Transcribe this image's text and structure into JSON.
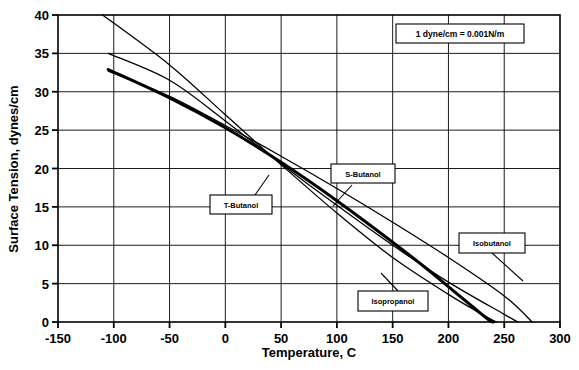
{
  "chart_data": {
    "type": "line",
    "title": "",
    "xlabel": "Temperature, C",
    "ylabel": "Surface Tension,  dynes/cm",
    "xlim": [
      -150,
      300
    ],
    "ylim": [
      0,
      40
    ],
    "xticks": [
      -150,
      -100,
      -50,
      0,
      50,
      100,
      150,
      200,
      250,
      300
    ],
    "yticks": [
      0,
      5,
      10,
      15,
      20,
      25,
      30,
      35,
      40
    ],
    "grid": true,
    "legend": "inline-callout-labels",
    "annotations": [
      {
        "name": "unit-note",
        "text": "1 dyne/cm = 0.001N/m"
      }
    ],
    "series": [
      {
        "name": "S-Butanol",
        "label": "S-Butanol",
        "emphasis": "thin",
        "points": [
          {
            "x": -110,
            "y": 40.0
          },
          {
            "x": -50,
            "y": 33.5
          },
          {
            "x": 0,
            "y": 27.0
          },
          {
            "x": 50,
            "y": 20.5
          },
          {
            "x": 100,
            "y": 14.2
          },
          {
            "x": 150,
            "y": 8.4
          },
          {
            "x": 200,
            "y": 3.6
          },
          {
            "x": 235,
            "y": 0.6
          },
          {
            "x": 243,
            "y": 0.0
          }
        ]
      },
      {
        "name": "T-Butanol",
        "label": "T-Butanol",
        "emphasis": "thin",
        "points": [
          {
            "x": -105,
            "y": 35.0
          },
          {
            "x": -50,
            "y": 31.5
          },
          {
            "x": 0,
            "y": 26.2
          },
          {
            "x": 50,
            "y": 20.6
          },
          {
            "x": 100,
            "y": 15.2
          },
          {
            "x": 150,
            "y": 10.0
          },
          {
            "x": 200,
            "y": 5.2
          },
          {
            "x": 250,
            "y": 1.0
          },
          {
            "x": 262,
            "y": 0.0
          }
        ]
      },
      {
        "name": "Isobutanol",
        "label": "Isobutanol",
        "emphasis": "thin",
        "points": [
          {
            "x": -105,
            "y": 32.7
          },
          {
            "x": -50,
            "y": 29.4
          },
          {
            "x": 0,
            "y": 25.6
          },
          {
            "x": 50,
            "y": 21.6
          },
          {
            "x": 100,
            "y": 17.4
          },
          {
            "x": 150,
            "y": 13.0
          },
          {
            "x": 200,
            "y": 8.4
          },
          {
            "x": 250,
            "y": 3.4
          },
          {
            "x": 275,
            "y": 0.0
          }
        ]
      },
      {
        "name": "Isopropanol",
        "label": "Isopropanol",
        "emphasis": "thick",
        "points": [
          {
            "x": -105,
            "y": 32.9
          },
          {
            "x": -50,
            "y": 29.2
          },
          {
            "x": 0,
            "y": 25.3
          },
          {
            "x": 50,
            "y": 20.8
          },
          {
            "x": 100,
            "y": 15.8
          },
          {
            "x": 150,
            "y": 10.4
          },
          {
            "x": 180,
            "y": 7.0
          },
          {
            "x": 205,
            "y": 4.0
          },
          {
            "x": 225,
            "y": 1.6
          },
          {
            "x": 236,
            "y": 0.3
          },
          {
            "x": 240,
            "y": 0.0
          }
        ]
      }
    ]
  },
  "axes": {
    "x_tick_labels": [
      "-150",
      "-100",
      "-50",
      "0",
      "50",
      "100",
      "150",
      "200",
      "250",
      "300"
    ],
    "y_tick_labels": [
      "0",
      "5",
      "10",
      "15",
      "20",
      "25",
      "30",
      "35",
      "40"
    ],
    "x_title": "Temperature, C",
    "y_title": "Surface Tension,  dynes/cm"
  },
  "callouts": {
    "unit_note": "1 dyne/cm = 0.001N/m",
    "s_butanol": "S-Butanol",
    "t_butanol": "T-Butanol",
    "isobutanol": "Isobutanol",
    "isopropanol": "Isopropanol"
  },
  "colors": {
    "background": "#ffffff",
    "ink": "#000000",
    "grid": "#000000"
  }
}
